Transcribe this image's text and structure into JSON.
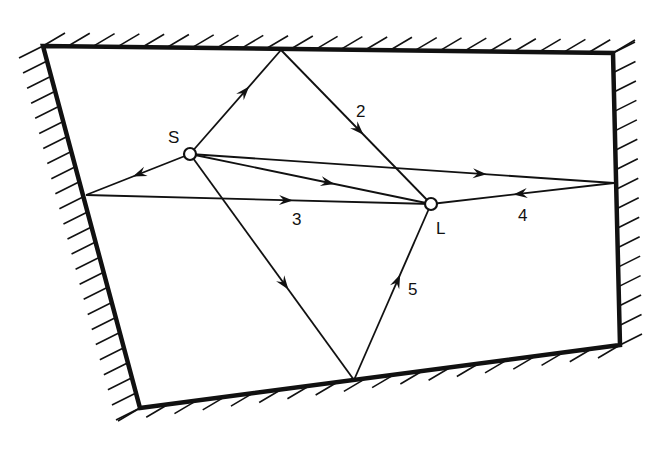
{
  "diagram": {
    "type": "multipath-propagation-room",
    "room_corners": [
      [
        43,
        46
      ],
      [
        613,
        53
      ],
      [
        620,
        345
      ],
      [
        140,
        408
      ]
    ],
    "source": {
      "label": "S",
      "x": 190,
      "y": 154
    },
    "listener": {
      "label": "L",
      "x": 431,
      "y": 204
    },
    "reflection_points": {
      "top": [
        281,
        50
      ],
      "left": [
        86,
        195
      ],
      "right": [
        614,
        183
      ],
      "bottom": [
        354,
        380
      ]
    },
    "paths": [
      {
        "id": "direct",
        "label": "",
        "description": "S to L direct"
      },
      {
        "id": "path-2",
        "label": "2",
        "via": "top wall"
      },
      {
        "id": "path-3",
        "label": "3",
        "via": "left wall"
      },
      {
        "id": "path-4",
        "label": "4",
        "via": "right wall"
      },
      {
        "id": "path-5",
        "label": "5",
        "via": "bottom wall"
      }
    ]
  },
  "labels": {
    "source": "S",
    "listener": "L",
    "path2": "2",
    "path3": "3",
    "path4": "4",
    "path5": "5"
  },
  "colors": {
    "ink": "#111111",
    "background": "#ffffff"
  }
}
